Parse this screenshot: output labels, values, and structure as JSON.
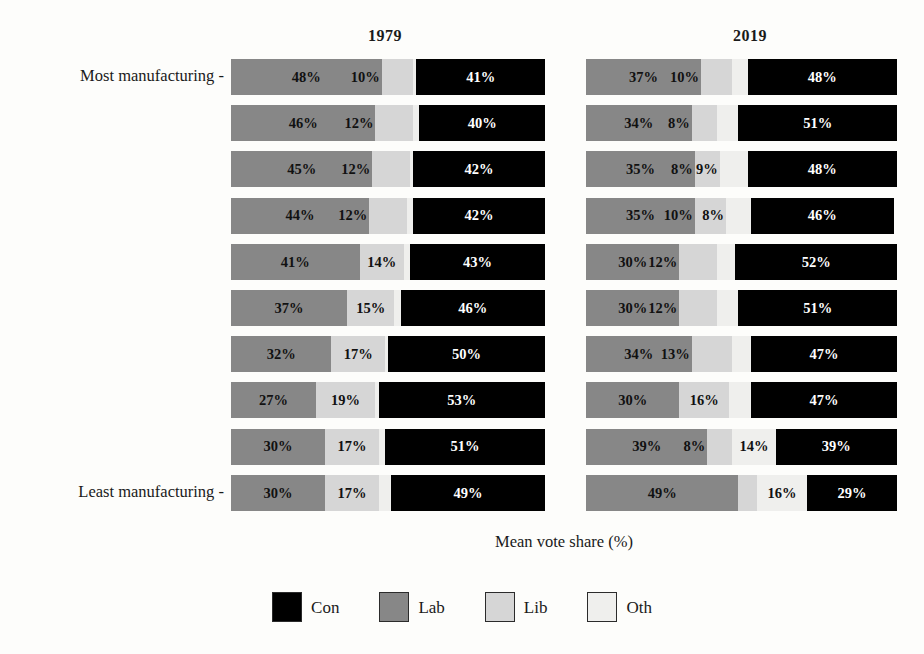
{
  "figure": {
    "xaxis_title": "Mean vote share (%)",
    "y_top_label": "Most manufacturing  -",
    "y_bottom_label": "Least manufacturing -"
  },
  "panels": [
    {
      "title": "1979"
    },
    {
      "title": "2019"
    }
  ],
  "legend": {
    "items": [
      {
        "key": "con",
        "label": "Con",
        "color": "#000000"
      },
      {
        "key": "lab",
        "label": "Lab",
        "color": "#878787"
      },
      {
        "key": "lib",
        "label": "Lib",
        "color": "#d6d6d6"
      },
      {
        "key": "oth",
        "label": "Oth",
        "color": "#efefed"
      }
    ]
  },
  "chart_data": {
    "type": "bar",
    "orientation": "horizontal",
    "stacked": true,
    "title": "",
    "xlabel": "Mean vote share (%)",
    "ylabel": "",
    "grid": false,
    "legend_position": "bottom",
    "facets": [
      "1979",
      "2019"
    ],
    "categories": [
      "Most manufacturing",
      "decile 2",
      "decile 3",
      "decile 4",
      "decile 5",
      "decile 6",
      "decile 7",
      "decile 8",
      "decile 9",
      "Least manufacturing"
    ],
    "series_order": [
      "Lab",
      "Lib",
      "Oth",
      "Con"
    ],
    "series_colors": {
      "Con": "#000000",
      "Lab": "#878787",
      "Lib": "#d6d6d6",
      "Oth": "#efefed"
    },
    "panels": [
      {
        "facet": "1979",
        "rows": [
          {
            "category": "Most manufacturing",
            "Lab": 48,
            "Lib": 10,
            "Oth": 1,
            "Con": 41
          },
          {
            "category": "decile 2",
            "Lab": 46,
            "Lib": 12,
            "Oth": 2,
            "Con": 40
          },
          {
            "category": "decile 3",
            "Lab": 45,
            "Lib": 12,
            "Oth": 1,
            "Con": 42
          },
          {
            "category": "decile 4",
            "Lab": 44,
            "Lib": 12,
            "Oth": 2,
            "Con": 42
          },
          {
            "category": "decile 5",
            "Lab": 41,
            "Lib": 14,
            "Oth": 2,
            "Con": 43
          },
          {
            "category": "decile 6",
            "Lab": 37,
            "Lib": 15,
            "Oth": 2,
            "Con": 46
          },
          {
            "category": "decile 7",
            "Lab": 32,
            "Lib": 17,
            "Oth": 1,
            "Con": 50
          },
          {
            "category": "decile 8",
            "Lab": 27,
            "Lib": 19,
            "Oth": 1,
            "Con": 53
          },
          {
            "category": "decile 9",
            "Lab": 30,
            "Lib": 17,
            "Oth": 2,
            "Con": 51
          },
          {
            "category": "Least manufacturing",
            "Lab": 30,
            "Lib": 17,
            "Oth": 4,
            "Con": 49
          }
        ]
      },
      {
        "facet": "2019",
        "rows": [
          {
            "category": "Most manufacturing",
            "Lab": 37,
            "Lib": 10,
            "Oth": 5,
            "Con": 48
          },
          {
            "category": "decile 2",
            "Lab": 34,
            "Lib": 8,
            "Oth": 7,
            "Con": 51
          },
          {
            "category": "decile 3",
            "Lab": 35,
            "Lib": 8,
            "Oth": 9,
            "Con": 48
          },
          {
            "category": "decile 4",
            "Lab": 35,
            "Lib": 10,
            "Oth": 8,
            "Con": 46
          },
          {
            "category": "decile 5",
            "Lab": 30,
            "Lib": 12,
            "Oth": 6,
            "Con": 52
          },
          {
            "category": "decile 6",
            "Lab": 30,
            "Lib": 12,
            "Oth": 7,
            "Con": 51
          },
          {
            "category": "decile 7",
            "Lab": 34,
            "Lib": 13,
            "Oth": 6,
            "Con": 47
          },
          {
            "category": "decile 8",
            "Lab": 30,
            "Lib": 16,
            "Oth": 7,
            "Con": 47
          },
          {
            "category": "decile 9",
            "Lab": 39,
            "Lib": 8,
            "Oth": 14,
            "Con": 39
          },
          {
            "category": "Least manufacturing",
            "Lab": 49,
            "Lib": 6,
            "Oth": 16,
            "Con": 29
          }
        ]
      }
    ],
    "labels": {
      "1979": [
        [
          "48%",
          "10%",
          "",
          "41%"
        ],
        [
          "46%",
          "12%",
          "",
          "40%"
        ],
        [
          "45%",
          "12%",
          "",
          "42%"
        ],
        [
          "44%",
          "12%",
          "",
          "42%"
        ],
        [
          "41%",
          "14%",
          "",
          "43%"
        ],
        [
          "37%",
          "15%",
          "",
          "46%"
        ],
        [
          "32%",
          "17%",
          "",
          "50%"
        ],
        [
          "27%",
          "19%",
          "",
          "53%"
        ],
        [
          "30%",
          "17%",
          "",
          "51%"
        ],
        [
          "30%",
          "17%",
          "",
          "49%"
        ]
      ],
      "2019": [
        [
          "37%",
          "10%",
          "",
          "48%"
        ],
        [
          "34%",
          "8%",
          "",
          "51%"
        ],
        [
          "35%",
          "8%",
          "9%",
          "48%"
        ],
        [
          "35%",
          "10%",
          "8%",
          "46%"
        ],
        [
          "30%",
          "12%",
          "",
          "52%"
        ],
        [
          "30%",
          "12%",
          "",
          "51%"
        ],
        [
          "34%",
          "13%",
          "",
          "47%"
        ],
        [
          "30%",
          "16%",
          "",
          "47%"
        ],
        [
          "39%",
          "8%",
          "14%",
          "39%"
        ],
        [
          "49%",
          "",
          "16%",
          "29%"
        ]
      ]
    }
  }
}
